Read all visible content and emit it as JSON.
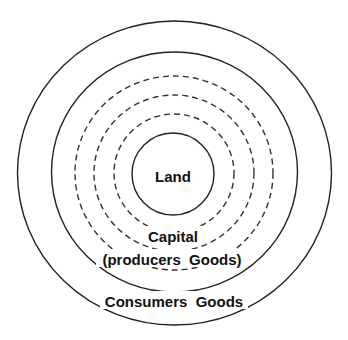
{
  "diagram": {
    "type": "concentric-circles",
    "center": {
      "x": 174.5,
      "y": 173
    },
    "colors": {
      "stroke": "#222222",
      "text": "#111111",
      "background": "#ffffff"
    },
    "rings": [
      {
        "id": "consumers-goods-ring",
        "style": "solid",
        "rx": 157,
        "ry": 152
      },
      {
        "id": "capital-ring",
        "style": "solid",
        "rx": 123,
        "ry": 120
      },
      {
        "id": "capital-dashed-1",
        "style": "dashed",
        "rx": 99,
        "ry": 97
      },
      {
        "id": "capital-dashed-2",
        "style": "dashed",
        "rx": 80,
        "ry": 78
      },
      {
        "id": "capital-dashed-3",
        "style": "dashed",
        "rx": 60,
        "ry": 59
      },
      {
        "id": "land-ring",
        "style": "solid",
        "rx": 41,
        "ry": 41
      }
    ],
    "labels": {
      "land": "Land",
      "capital": "Capital",
      "capital_sub": "(producers  Goods)",
      "consumers": "Consumers  Goods"
    }
  }
}
